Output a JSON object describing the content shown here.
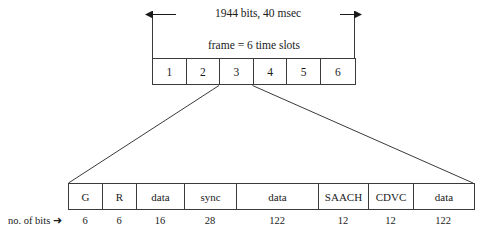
{
  "diagram": {
    "top_dimension_label": "1944 bits, 40 msec",
    "frame_caption": "frame = 6 time slots",
    "bits_label": "no. of  bits",
    "bits_arrow_glyph": "➜",
    "line_color": "#3a3a3a",
    "background_color": "#ffffff",
    "slots": [
      {
        "label": "1"
      },
      {
        "label": "2"
      },
      {
        "label": "3"
      },
      {
        "label": "4"
      },
      {
        "label": "5"
      },
      {
        "label": "6"
      }
    ],
    "burst_fields": [
      {
        "label": "G",
        "bits": "6",
        "width_px": 34
      },
      {
        "label": "R",
        "bits": "6",
        "width_px": 34
      },
      {
        "label": "data",
        "bits": "16",
        "width_px": 48
      },
      {
        "label": "sync",
        "bits": "28",
        "width_px": 52
      },
      {
        "label": "data",
        "bits": "122",
        "width_px": 82
      },
      {
        "label": "SAACH",
        "bits": "12",
        "width_px": 50
      },
      {
        "label": "CDVC",
        "bits": "12",
        "width_px": 45
      },
      {
        "label": "data",
        "bits": "122",
        "width_px": 60
      }
    ],
    "expanded_slot_index": 2
  }
}
